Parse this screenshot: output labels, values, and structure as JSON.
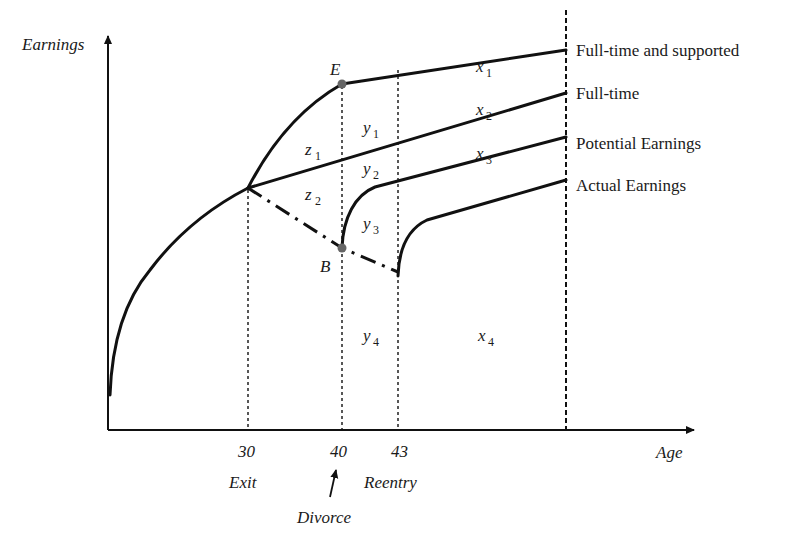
{
  "diagram": {
    "axes": {
      "y_label": "Earnings",
      "x_label": "Age"
    },
    "x_ticks": [
      {
        "value": "30",
        "caption": "Exit"
      },
      {
        "value": "40",
        "caption": "Divorce"
      },
      {
        "value": "43",
        "caption": "Reentry"
      }
    ],
    "series": [
      {
        "name": "Full-time and supported",
        "style": "solid"
      },
      {
        "name": "Full-time",
        "style": "solid"
      },
      {
        "name": "Potential Earnings",
        "style": "solid"
      },
      {
        "name": "Actual Earnings",
        "style": "solid"
      }
    ],
    "points": {
      "E": "E",
      "B": "B"
    },
    "regions": {
      "x1": {
        "base": "x",
        "sub": "1"
      },
      "x2": {
        "base": "x",
        "sub": "2"
      },
      "x3": {
        "base": "x",
        "sub": "3"
      },
      "x4": {
        "base": "x",
        "sub": "4"
      },
      "y1": {
        "base": "y",
        "sub": "1"
      },
      "y2": {
        "base": "y",
        "sub": "2"
      },
      "y3": {
        "base": "y",
        "sub": "3"
      },
      "y4": {
        "base": "y",
        "sub": "4"
      },
      "z1": {
        "base": "z",
        "sub": "1"
      },
      "z2": {
        "base": "z",
        "sub": "2"
      }
    },
    "colors": {
      "line": "#111111",
      "marker": "#666666",
      "background": "#ffffff"
    }
  }
}
